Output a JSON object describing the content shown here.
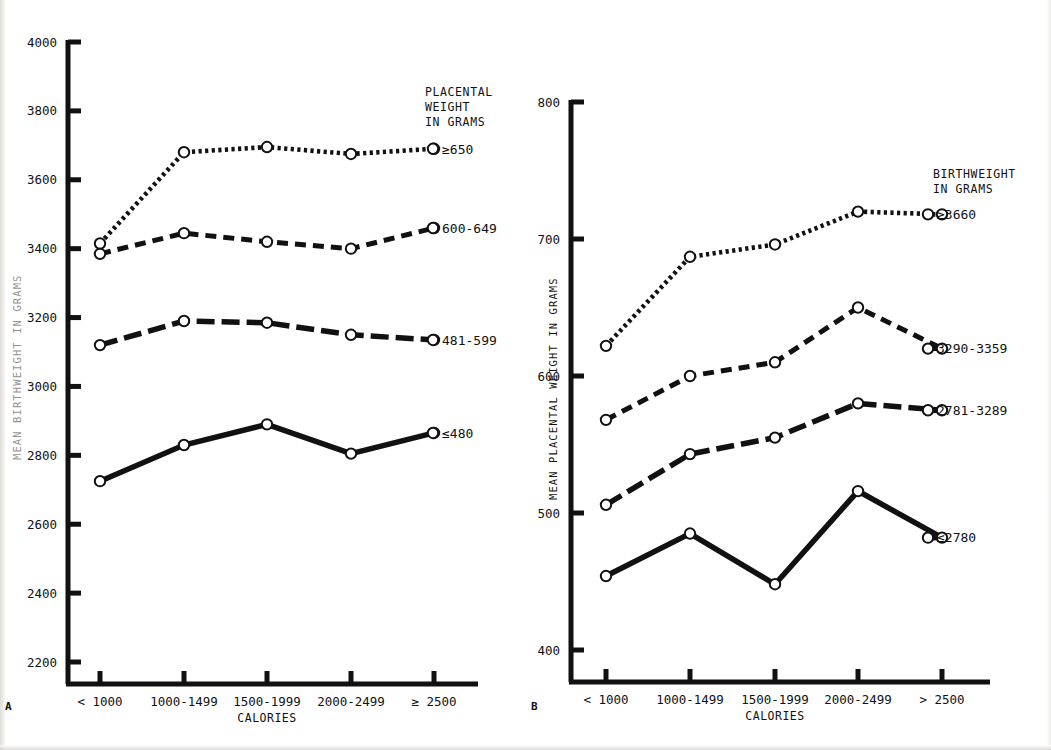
{
  "figure": {
    "panels": [
      {
        "letter": "A",
        "y_axis_title": "MEAN BIRTHWEIGHT IN GRAMS",
        "y_axis_title_clipped": true,
        "x_axis_title": "CALORIES",
        "legend_title_lines": [
          "PLACENTAL",
          "WEIGHT",
          "IN GRAMS"
        ]
      },
      {
        "letter": "B",
        "y_axis_title": "MEAN PLACENTAL WEIGHT IN GRAMS",
        "y_axis_title_clipped": false,
        "x_axis_title": "CALORIES",
        "legend_title_lines": [
          "BIRTHWEIGHT",
          "IN GRAMS"
        ]
      }
    ]
  },
  "chart_data": [
    {
      "type": "line",
      "panel": "A",
      "title": "",
      "xlabel": "CALORIES",
      "ylabel": "MEAN BIRTHWEIGHT IN GRAMS",
      "legend_title": "PLACENTAL WEIGHT IN GRAMS",
      "legend_position": "right-of-line-ends",
      "grid": false,
      "categories": [
        "< 1000",
        "1000-1499",
        "1500-1999",
        "2000-2499",
        "≥ 2500"
      ],
      "ylim": [
        2200,
        4000
      ],
      "yticks": [
        2200,
        2400,
        2600,
        2800,
        3000,
        3200,
        3400,
        3600,
        3800,
        4000
      ],
      "ytick_labels": [
        "2200",
        "2400",
        "2600",
        "2800",
        "3000",
        "3200",
        "3400",
        "3600",
        "3800",
        "4000"
      ],
      "series": [
        {
          "name": "≥650",
          "style": "dotted",
          "values": [
            3415,
            3680,
            3695,
            3675,
            3690
          ]
        },
        {
          "name": "600-649",
          "style": "dashed",
          "values": [
            3385,
            3445,
            3420,
            3400,
            3460
          ]
        },
        {
          "name": "481-599",
          "style": "long-dash",
          "values": [
            3120,
            3190,
            3185,
            3150,
            3135
          ]
        },
        {
          "name": "≤480",
          "style": "solid",
          "values": [
            2725,
            2830,
            2890,
            2805,
            2865
          ]
        }
      ]
    },
    {
      "type": "line",
      "panel": "B",
      "title": "",
      "xlabel": "CALORIES",
      "ylabel": "MEAN PLACENTAL WEIGHT IN GRAMS",
      "legend_title": "BIRTHWEIGHT IN GRAMS",
      "legend_position": "right-of-line-ends",
      "grid": false,
      "categories": [
        "< 1000",
        "1000-1499",
        "1500-1999",
        "2000-2499",
        "> 2500"
      ],
      "ylim": [
        400,
        800
      ],
      "yticks": [
        400,
        500,
        600,
        700,
        800
      ],
      "ytick_labels": [
        "400",
        "500",
        "600",
        "700",
        "800"
      ],
      "series": [
        {
          "name": "≥3660",
          "style": "dotted",
          "values": [
            622,
            687,
            696,
            720,
            718
          ]
        },
        {
          "name": "3290-3359",
          "style": "dashed",
          "values": [
            568,
            600,
            610,
            650,
            620
          ]
        },
        {
          "name": "2781-3289",
          "style": "long-dash",
          "values": [
            506,
            543,
            555,
            580,
            575
          ]
        },
        {
          "name": "≤2780",
          "style": "solid",
          "values": [
            454,
            485,
            448,
            516,
            482
          ]
        }
      ]
    }
  ]
}
